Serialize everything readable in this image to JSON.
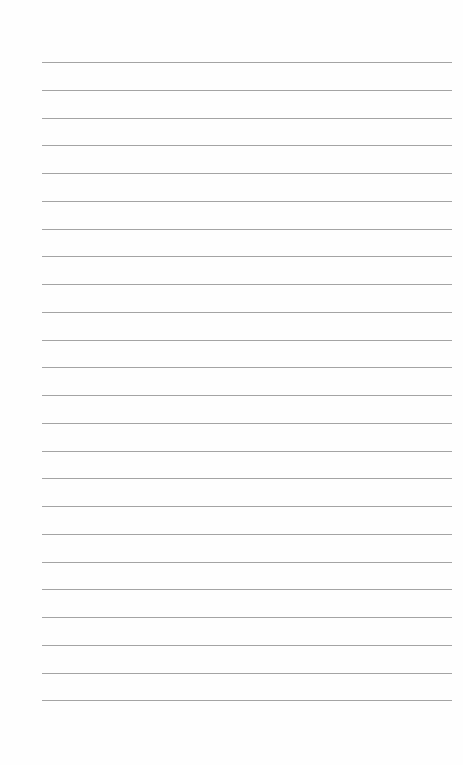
{
  "page": {
    "type": "lined-paper",
    "line_count": 24,
    "first_line_y": 62,
    "line_spacing": 27.75,
    "line_left": 42,
    "line_width": 410,
    "line_color": "#a4a4a4",
    "background_color": "#fefefe"
  }
}
